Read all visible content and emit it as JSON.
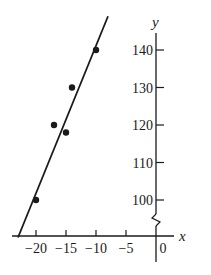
{
  "chart_data": {
    "type": "scatter",
    "title": "",
    "xlabel": "x",
    "ylabel": "y",
    "xlim": [
      -22,
      5
    ],
    "ylim": [
      92,
      145
    ],
    "grid": false,
    "legend": null,
    "y_axis_break": true,
    "x_ticks": [
      -20,
      -15,
      -10,
      -5,
      0
    ],
    "x_tick_labels": [
      "−20",
      "−15",
      "−10",
      "−5",
      "0"
    ],
    "y_ticks": [
      100,
      110,
      120,
      130,
      140
    ],
    "y_tick_labels": [
      "100",
      "110",
      "120",
      "130",
      "140"
    ],
    "series": [
      {
        "name": "data points",
        "type": "scatter",
        "points": [
          {
            "x": -20,
            "y": 100
          },
          {
            "x": -17,
            "y": 120
          },
          {
            "x": -15,
            "y": 118
          },
          {
            "x": -14,
            "y": 130
          },
          {
            "x": -10,
            "y": 140
          }
        ]
      },
      {
        "name": "fitted line",
        "type": "line",
        "points": [
          {
            "x": -23,
            "y": 90
          },
          {
            "x": -8,
            "y": 149
          }
        ]
      }
    ]
  },
  "colors": {
    "ink": "#1a1a1a",
    "background": "#ffffff"
  }
}
